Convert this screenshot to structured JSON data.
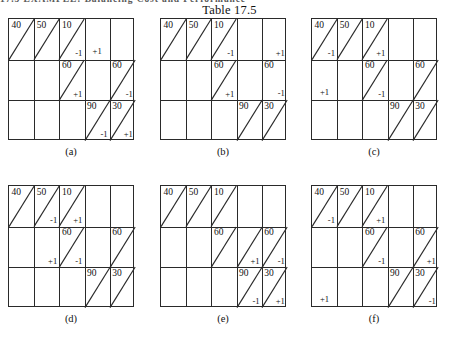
{
  "running_head": "17.5 EXAMPLE:  Balancing Cost and Performance",
  "caption": "Table 17.5",
  "grid": {
    "columns": 5,
    "rows": 3
  },
  "panels": [
    {
      "id": "a",
      "label": "(a)",
      "cells": [
        {
          "row": 1,
          "col": 1,
          "value": "40",
          "diagonal": true,
          "delta": "",
          "delta_pos": ""
        },
        {
          "row": 1,
          "col": 2,
          "value": "50",
          "diagonal": true,
          "delta": "",
          "delta_pos": ""
        },
        {
          "row": 1,
          "col": 3,
          "value": "10",
          "diagonal": true,
          "delta": "-1",
          "delta_pos": "br"
        },
        {
          "row": 1,
          "col": 4,
          "value": "",
          "diagonal": false,
          "delta": "+1",
          "delta_pos": "bc"
        },
        {
          "row": 2,
          "col": 3,
          "value": "60",
          "diagonal": true,
          "delta": "+1",
          "delta_pos": "br"
        },
        {
          "row": 2,
          "col": 5,
          "value": "60",
          "diagonal": true,
          "delta": "-1",
          "delta_pos": "br"
        },
        {
          "row": 3,
          "col": 4,
          "value": "90",
          "diagonal": true,
          "delta": "-1",
          "delta_pos": "br"
        },
        {
          "row": 3,
          "col": 5,
          "value": "30",
          "diagonal": true,
          "delta": "+1",
          "delta_pos": "br"
        }
      ]
    },
    {
      "id": "b",
      "label": "(b)",
      "cells": [
        {
          "row": 1,
          "col": 1,
          "value": "40",
          "diagonal": true,
          "delta": "",
          "delta_pos": ""
        },
        {
          "row": 1,
          "col": 2,
          "value": "50",
          "diagonal": true,
          "delta": "",
          "delta_pos": ""
        },
        {
          "row": 1,
          "col": 3,
          "value": "10",
          "diagonal": true,
          "delta": "-1",
          "delta_pos": "br"
        },
        {
          "row": 1,
          "col": 5,
          "value": "",
          "diagonal": false,
          "delta": "+1",
          "delta_pos": "mr"
        },
        {
          "row": 2,
          "col": 3,
          "value": "60",
          "diagonal": true,
          "delta": "+1",
          "delta_pos": "br"
        },
        {
          "row": 2,
          "col": 5,
          "value": "60",
          "diagonal": false,
          "delta": "-1",
          "delta_pos": "mr"
        },
        {
          "row": 3,
          "col": 4,
          "value": "90",
          "diagonal": true,
          "delta": "",
          "delta_pos": ""
        },
        {
          "row": 3,
          "col": 5,
          "value": "30",
          "diagonal": true,
          "delta": "",
          "delta_pos": ""
        }
      ]
    },
    {
      "id": "c",
      "label": "(c)",
      "cells": [
        {
          "row": 1,
          "col": 1,
          "value": "40",
          "diagonal": true,
          "delta": "-1",
          "delta_pos": "br"
        },
        {
          "row": 1,
          "col": 2,
          "value": "50",
          "diagonal": true,
          "delta": "",
          "delta_pos": ""
        },
        {
          "row": 1,
          "col": 3,
          "value": "10",
          "diagonal": true,
          "delta": "+1",
          "delta_pos": "br"
        },
        {
          "row": 2,
          "col": 1,
          "value": "",
          "diagonal": false,
          "delta": "+1",
          "delta_pos": "bc"
        },
        {
          "row": 2,
          "col": 3,
          "value": "60",
          "diagonal": true,
          "delta": "-1",
          "delta_pos": "br"
        },
        {
          "row": 2,
          "col": 5,
          "value": "60",
          "diagonal": true,
          "delta": "",
          "delta_pos": ""
        },
        {
          "row": 3,
          "col": 4,
          "value": "90",
          "diagonal": true,
          "delta": "",
          "delta_pos": ""
        },
        {
          "row": 3,
          "col": 5,
          "value": "30",
          "diagonal": true,
          "delta": "",
          "delta_pos": ""
        }
      ]
    },
    {
      "id": "d",
      "label": "(d)",
      "cells": [
        {
          "row": 1,
          "col": 1,
          "value": "40",
          "diagonal": true,
          "delta": "",
          "delta_pos": ""
        },
        {
          "row": 1,
          "col": 2,
          "value": "50",
          "diagonal": true,
          "delta": "-1",
          "delta_pos": "br"
        },
        {
          "row": 1,
          "col": 3,
          "value": "10",
          "diagonal": true,
          "delta": "+1",
          "delta_pos": "br"
        },
        {
          "row": 2,
          "col": 2,
          "value": "",
          "diagonal": false,
          "delta": "+1",
          "delta_pos": "br"
        },
        {
          "row": 2,
          "col": 3,
          "value": "60",
          "diagonal": true,
          "delta": "-1",
          "delta_pos": "br"
        },
        {
          "row": 2,
          "col": 5,
          "value": "60",
          "diagonal": true,
          "delta": "",
          "delta_pos": ""
        },
        {
          "row": 3,
          "col": 4,
          "value": "90",
          "diagonal": true,
          "delta": "",
          "delta_pos": ""
        },
        {
          "row": 3,
          "col": 5,
          "value": "30",
          "diagonal": true,
          "delta": "",
          "delta_pos": ""
        }
      ]
    },
    {
      "id": "e",
      "label": "(e)",
      "cells": [
        {
          "row": 1,
          "col": 1,
          "value": "40",
          "diagonal": true,
          "delta": "",
          "delta_pos": ""
        },
        {
          "row": 1,
          "col": 2,
          "value": "50",
          "diagonal": true,
          "delta": "",
          "delta_pos": ""
        },
        {
          "row": 1,
          "col": 3,
          "value": "10",
          "diagonal": true,
          "delta": "",
          "delta_pos": ""
        },
        {
          "row": 2,
          "col": 3,
          "value": "60",
          "diagonal": true,
          "delta": "",
          "delta_pos": ""
        },
        {
          "row": 2,
          "col": 4,
          "value": "",
          "diagonal": true,
          "delta": "+1",
          "delta_pos": "br"
        },
        {
          "row": 2,
          "col": 5,
          "value": "60",
          "diagonal": true,
          "delta": "-1",
          "delta_pos": "br"
        },
        {
          "row": 3,
          "col": 4,
          "value": "90",
          "diagonal": true,
          "delta": "-1",
          "delta_pos": "br"
        },
        {
          "row": 3,
          "col": 5,
          "value": "30",
          "diagonal": true,
          "delta": "+1",
          "delta_pos": "br"
        }
      ]
    },
    {
      "id": "f",
      "label": "(f)",
      "cells": [
        {
          "row": 1,
          "col": 1,
          "value": "40",
          "diagonal": true,
          "delta": "-1",
          "delta_pos": "br"
        },
        {
          "row": 1,
          "col": 2,
          "value": "50",
          "diagonal": true,
          "delta": "",
          "delta_pos": ""
        },
        {
          "row": 1,
          "col": 3,
          "value": "10",
          "diagonal": true,
          "delta": "+1",
          "delta_pos": "br"
        },
        {
          "row": 2,
          "col": 3,
          "value": "60",
          "diagonal": true,
          "delta": "-1",
          "delta_pos": "br"
        },
        {
          "row": 2,
          "col": 5,
          "value": "60",
          "diagonal": true,
          "delta": "+1",
          "delta_pos": "br"
        },
        {
          "row": 3,
          "col": 1,
          "value": "",
          "diagonal": false,
          "delta": "+1",
          "delta_pos": "bc"
        },
        {
          "row": 3,
          "col": 4,
          "value": "90",
          "diagonal": true,
          "delta": "",
          "delta_pos": ""
        },
        {
          "row": 3,
          "col": 5,
          "value": "30",
          "diagonal": true,
          "delta": "-1",
          "delta_pos": "br"
        }
      ]
    }
  ]
}
